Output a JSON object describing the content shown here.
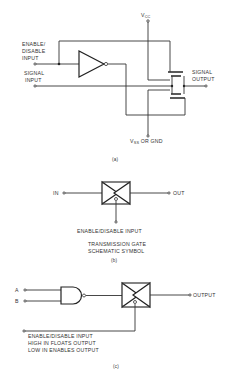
{
  "figure_a": {
    "vcc_label": "V",
    "vcc_sub": "CC",
    "enable_label_1": "ENABLE/",
    "enable_label_2": "DISABLE",
    "enable_label_3": "INPUT",
    "signal_input_1": "SIGNAL",
    "signal_input_2": "INPUT",
    "signal_output_1": "SIGNAL",
    "signal_output_2": "OUTPUT",
    "vss_label": "V",
    "vss_sub": "SS",
    "vss_suffix": " OR GND",
    "caption": "(a)"
  },
  "figure_b": {
    "in_label": "IN",
    "out_label": "OUT",
    "enable_label": "ENABLE/DISABLE INPUT",
    "title_1": "TRANSMISSION  GATE",
    "title_2": "SCHEMATIC SYMBOL",
    "caption": "(b)"
  },
  "figure_c": {
    "input_a": "A",
    "input_b": "B",
    "output_label": "OUTPUT",
    "enable_1": "ENABLE/DISABLE INPUT",
    "enable_2": "HIGH IN FLOATS OUTPUT",
    "enable_3": "LOW IN ENABLES OUTPUT",
    "caption": "(c)"
  }
}
